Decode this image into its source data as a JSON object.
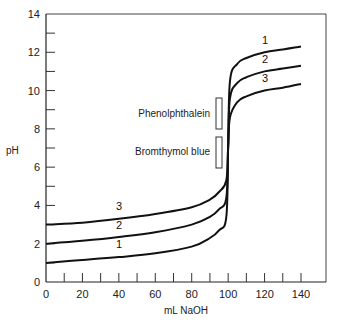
{
  "chart_data": {
    "type": "line",
    "title": "",
    "xlabel": "mL NaOH",
    "ylabel": "pH",
    "xlim": [
      0,
      155
    ],
    "ylim": [
      0,
      14
    ],
    "grid": false,
    "x_ticks": [
      0,
      20,
      40,
      60,
      80,
      100,
      120,
      140
    ],
    "x_minor_ticks": [
      10,
      30,
      50,
      70,
      90,
      110,
      130
    ],
    "y_ticks": [
      0,
      2,
      4,
      6,
      8,
      10,
      12,
      14
    ],
    "y_minor_ticks": [
      1,
      3,
      5,
      7,
      9,
      11,
      13
    ],
    "x": [
      0,
      20,
      40,
      60,
      80,
      90,
      95,
      99,
      100,
      101,
      105,
      110,
      120,
      130,
      140
    ],
    "series": [
      {
        "name": "1",
        "values": [
          1.0,
          1.15,
          1.3,
          1.5,
          1.85,
          2.3,
          2.7,
          3.4,
          7.0,
          10.5,
          11.4,
          11.7,
          12.0,
          12.15,
          12.3
        ]
      },
      {
        "name": "2",
        "values": [
          2.0,
          2.15,
          2.35,
          2.6,
          3.0,
          3.4,
          3.8,
          4.4,
          7.0,
          9.6,
          10.4,
          10.7,
          11.0,
          11.15,
          11.3
        ]
      },
      {
        "name": "3",
        "values": [
          3.0,
          3.1,
          3.3,
          3.55,
          3.9,
          4.3,
          4.7,
          5.3,
          7.0,
          8.6,
          9.4,
          9.7,
          10.0,
          10.15,
          10.35
        ]
      }
    ],
    "curve_labels": [
      {
        "text": "1",
        "x": 40,
        "y": 1.6
      },
      {
        "text": "2",
        "x": 40,
        "y": 2.6
      },
      {
        "text": "3",
        "x": 40,
        "y": 3.6
      },
      {
        "text": "1",
        "x": 120,
        "y": 12.6
      },
      {
        "text": "2",
        "x": 120,
        "y": 11.6
      },
      {
        "text": "3",
        "x": 120,
        "y": 10.6
      }
    ],
    "annotations": [
      {
        "text": "Phenolphthalein",
        "type": "indicator-range",
        "x": 94.5,
        "ph_low": 8.0,
        "ph_high": 9.6
      },
      {
        "text": "Bromthymol blue",
        "type": "indicator-range",
        "x": 94.5,
        "ph_low": 6.0,
        "ph_high": 7.6
      }
    ],
    "legend": "none (curves labeled inline 1, 2, 3)"
  },
  "axes": {
    "x_label": "mL NaOH",
    "y_label": "pH",
    "x_tick_labels": [
      "0",
      "20",
      "40",
      "60",
      "80",
      "100",
      "120",
      "140"
    ],
    "y_tick_labels": [
      "0",
      "2",
      "4",
      "6",
      "8",
      "10",
      "12",
      "14"
    ]
  },
  "indicators": {
    "phenolphthalein": "Phenolphthalein",
    "bromthymol": "Bromthymol blue"
  },
  "curve_labels": [
    "1",
    "2",
    "3"
  ],
  "colors": {
    "line": "#111111",
    "axis": "#333333",
    "background": "#ffffff"
  }
}
